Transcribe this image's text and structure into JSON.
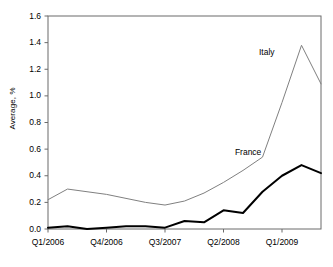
{
  "chart_data": {
    "type": "line",
    "title": "",
    "xlabel": "",
    "ylabel": "Average, %",
    "ylim": [
      0.0,
      1.6
    ],
    "yticks": [
      "0.0",
      "0.2",
      "0.4",
      "0.6",
      "0.8",
      "1.0",
      "1.2",
      "1.4",
      "1.6"
    ],
    "ytick_values": [
      0.0,
      0.2,
      0.4,
      0.6,
      0.8,
      1.0,
      1.2,
      1.4,
      1.6
    ],
    "grid": false,
    "legend_position": "inline-annotation",
    "x": [
      "Q1/2006",
      "Q2/2006",
      "Q3/2006",
      "Q4/2006",
      "Q1/2007",
      "Q2/2007",
      "Q3/2007",
      "Q4/2007",
      "Q1/2008",
      "Q2/2008",
      "Q3/2008",
      "Q4/2008",
      "Q1/2009",
      "Q2/2009",
      "Q3/2009"
    ],
    "xtick_labels": [
      "Q1/2006",
      "Q4/2006",
      "Q3/2007",
      "Q2/2008",
      "Q1/2009"
    ],
    "xtick_indices": [
      0,
      3,
      6,
      9,
      12
    ],
    "series": [
      {
        "name": "Italy",
        "color": "#808080",
        "width": 1,
        "values": [
          0.22,
          0.3,
          0.28,
          0.26,
          0.23,
          0.2,
          0.18,
          0.21,
          0.27,
          0.35,
          0.44,
          0.54,
          0.95,
          1.38,
          1.09
        ]
      },
      {
        "name": "France",
        "color": "#000000",
        "width": 2,
        "values": [
          0.01,
          0.02,
          0.0,
          0.01,
          0.02,
          0.02,
          0.01,
          0.06,
          0.05,
          0.14,
          0.12,
          0.28,
          0.4,
          0.48,
          0.42
        ]
      }
    ],
    "annotations": [
      {
        "text": "Italy",
        "x_index": 12,
        "y_value": 1.33
      },
      {
        "text": "France",
        "x_index": 11,
        "y_value": 0.58
      }
    ]
  }
}
